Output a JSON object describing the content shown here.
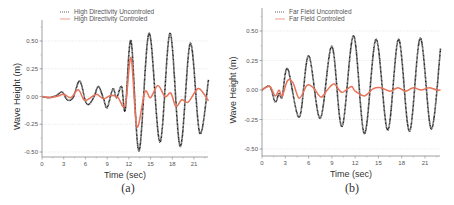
{
  "colors": {
    "uncontrolled": "#1a1a1a",
    "controlled": "#e8735a",
    "axis": "#888888",
    "grid": "#e6e6e6"
  },
  "chart_data": [
    {
      "type": "line",
      "panel": "a",
      "caption": "(a)",
      "xlabel": "Time (sec)",
      "ylabel": "Wave Height (m)",
      "xlim": [
        0,
        23
      ],
      "ylim": [
        -0.55,
        0.65
      ],
      "xticks": [
        0,
        3,
        6,
        9,
        12,
        15,
        18,
        21
      ],
      "xtick_labels": [
        "0",
        "3",
        "6",
        "9",
        "12",
        "15",
        "18",
        "21"
      ],
      "yticks": [
        0.5,
        0.25,
        0.0,
        -0.25,
        -0.5
      ],
      "ytick_labels": [
        "0.50",
        "0.25",
        "0.00",
        "-0.25",
        "-0.50"
      ],
      "grid": true,
      "legend_position": "top-left",
      "series": [
        {
          "name": "High Directivity Uncontroled",
          "style": "black dotted/thick line",
          "x": [
            0,
            1,
            2,
            2.8,
            3.5,
            4.3,
            5.2,
            6,
            6.5,
            7.2,
            7.8,
            8.5,
            9,
            9.8,
            10.3,
            11,
            11.5,
            12.3,
            13.4,
            14.8,
            16.3,
            17.7,
            19.1,
            20.5,
            21.8,
            23
          ],
          "values": [
            0,
            -0.01,
            0.01,
            0.04,
            -0.03,
            -0.01,
            0.14,
            -0.04,
            -0.07,
            0.0,
            0.09,
            -0.02,
            -0.1,
            0.07,
            -0.01,
            0.09,
            -0.12,
            0.5,
            -0.49,
            0.57,
            -0.41,
            0.57,
            -0.45,
            0.48,
            -0.33,
            0.15
          ]
        },
        {
          "name": "High Directivity Controled",
          "style": "red/orange line",
          "x": [
            0,
            1,
            2,
            3,
            4,
            5,
            5.8,
            6.5,
            7.5,
            8.5,
            9.5,
            10.5,
            11.5,
            12.3,
            13.1,
            14.2,
            15,
            16,
            17,
            17.8,
            18.5,
            19.3,
            20.2,
            21.5,
            22.3,
            23
          ],
          "values": [
            0,
            -0.01,
            0.0,
            0.02,
            -0.01,
            0.06,
            -0.03,
            -0.02,
            0.02,
            -0.02,
            0.01,
            -0.01,
            -0.08,
            0.35,
            -0.27,
            0.04,
            -0.01,
            0.1,
            0.0,
            0.03,
            -0.09,
            -0.03,
            -0.05,
            0.07,
            0.03,
            -0.04
          ]
        }
      ]
    },
    {
      "type": "line",
      "panel": "b",
      "caption": "(b)",
      "xlabel": "Time (sec)",
      "ylabel": "Wave Height (m)",
      "xlim": [
        0,
        23
      ],
      "ylim": [
        -0.55,
        0.65
      ],
      "xticks": [
        0,
        3,
        6,
        9,
        12,
        15,
        18,
        21
      ],
      "xtick_labels": [
        "0",
        "3",
        "6",
        "9",
        "12",
        "15",
        "18",
        "21"
      ],
      "yticks": [
        0.5,
        0.25,
        0.0,
        -0.25,
        -0.5
      ],
      "ytick_labels": [
        "0.50",
        "0.25",
        "0.00",
        "-0.25",
        "-0.50"
      ],
      "grid": true,
      "legend_position": "top-left",
      "series": [
        {
          "name": "Far Field Uncontroled",
          "style": "black dotted/thick line",
          "x": [
            0,
            1,
            1.7,
            2.2,
            2.6,
            3.3,
            4.8,
            6,
            7.5,
            9,
            10.3,
            11.8,
            13.2,
            14.7,
            16.2,
            17.6,
            19,
            20.4,
            21.8,
            23
          ],
          "values": [
            0,
            0.03,
            -0.1,
            -0.03,
            -0.06,
            0.18,
            -0.23,
            0.29,
            -0.24,
            0.37,
            -0.31,
            0.46,
            -0.37,
            0.43,
            -0.34,
            0.43,
            -0.35,
            0.44,
            -0.33,
            0.35
          ]
        },
        {
          "name": "Far Field Controled",
          "style": "red/orange line",
          "x": [
            0,
            1,
            1.7,
            2.2,
            2.6,
            3.3,
            4.0,
            4.8,
            5.8,
            6.6,
            7.6,
            8.4,
            9.3,
            10.3,
            11.5,
            12.0,
            13.2,
            14.3,
            15.3,
            16.5,
            17.5,
            18.5,
            19.5,
            20.5,
            21.5,
            22.5,
            23
          ],
          "values": [
            0,
            0.03,
            -0.05,
            0.0,
            -0.05,
            0.08,
            0.06,
            -0.07,
            0.04,
            0.02,
            -0.06,
            0.0,
            0.05,
            -0.02,
            0.03,
            -0.01,
            -0.05,
            0.01,
            0.02,
            -0.01,
            0.02,
            -0.01,
            0.02,
            0.0,
            0.02,
            0.0,
            0.0
          ]
        }
      ]
    }
  ]
}
